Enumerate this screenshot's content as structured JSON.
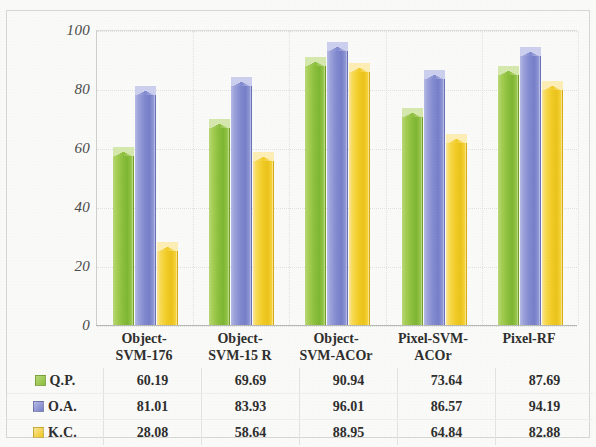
{
  "chart_data": {
    "type": "bar",
    "title": "",
    "subtitle": "",
    "xlabel": "",
    "ylabel": "",
    "ylim": [
      0,
      100
    ],
    "yticks": [
      0,
      20,
      40,
      60,
      80,
      100
    ],
    "grid": true,
    "legend_position": "table-left",
    "categories": [
      "Object-SVM-176",
      "Object-SVM-15 R",
      "Object-SVM-ACOr",
      "Pixel-SVM-ACOr",
      "Pixel-RF"
    ],
    "category_lines": [
      [
        "Object-",
        "SVM-176"
      ],
      [
        "Object-",
        "SVM-15 R"
      ],
      [
        "Object-",
        "SVM-ACOr"
      ],
      [
        "Pixel-SVM-",
        "ACOr"
      ],
      [
        "Pixel-RF"
      ]
    ],
    "series": [
      {
        "name": "Q.P.",
        "color": "#8cc03c",
        "values": [
          60.19,
          69.69,
          90.94,
          73.64,
          87.69
        ]
      },
      {
        "name": "O.A.",
        "color": "#828ad0",
        "values": [
          81.01,
          83.93,
          96.01,
          86.57,
          94.19
        ]
      },
      {
        "name": "K.C.",
        "color": "#f3cd25",
        "values": [
          28.08,
          58.64,
          88.95,
          64.84,
          82.88
        ]
      }
    ]
  },
  "table": {
    "rows": [
      {
        "label": "Q.P.",
        "swatch": "green-square-icon",
        "cells": [
          "60.19",
          "69.69",
          "90.94",
          "73.64",
          "87.69"
        ]
      },
      {
        "label": "O.A.",
        "swatch": "blue-square-icon",
        "cells": [
          "81.01",
          "83.93",
          "96.01",
          "86.57",
          "94.19"
        ]
      },
      {
        "label": "K.C.",
        "swatch": "yellow-square-icon",
        "cells": [
          "28.08",
          "58.64",
          "88.95",
          "64.84",
          "82.88"
        ]
      }
    ]
  },
  "axis": {
    "y_tick_labels": [
      "100",
      "80",
      "60",
      "40",
      "20",
      "0"
    ]
  }
}
